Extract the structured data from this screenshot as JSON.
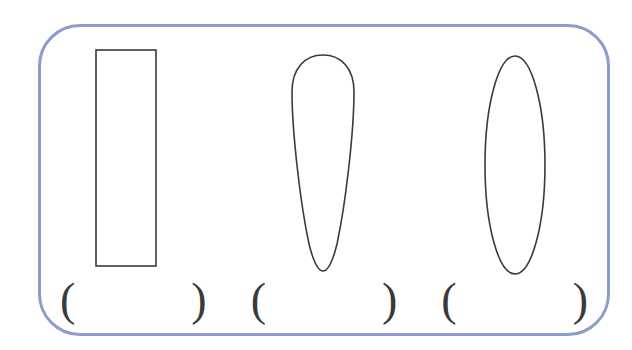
{
  "panel": {
    "border_color": "#8c9ccc",
    "background_color": "#ffffff",
    "corner_radius_px": 42
  },
  "stroke": {
    "shape_outline_color": "#3a3a3a",
    "text_color": "#3a3a3a"
  },
  "shapes": [
    {
      "index": 1,
      "name": "rectangle",
      "description": "tall narrow upright rectangle",
      "outline_color": "#3a3a3a",
      "filled": false
    },
    {
      "index": 2,
      "name": "teardrop",
      "description": "inverted teardrop, rounded wide top tapering to a point at the bottom",
      "outline_color": "#3a3a3a",
      "filled": false
    },
    {
      "index": 3,
      "name": "ellipse",
      "description": "tall narrow vertical ellipse",
      "outline_color": "#3a3a3a",
      "filled": false
    }
  ],
  "answer_blanks": [
    {
      "index": 1,
      "open": "(",
      "close": ")",
      "value": ""
    },
    {
      "index": 2,
      "open": "(",
      "close": ")",
      "value": ""
    },
    {
      "index": 3,
      "open": "(",
      "close": ")",
      "value": ""
    }
  ]
}
